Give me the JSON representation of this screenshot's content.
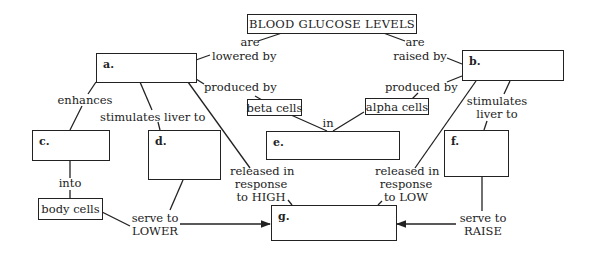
{
  "diagram": {
    "title": "BLOOD GLUCOSE LEVELS",
    "boxes": {
      "a": "a.",
      "b": "b.",
      "c": "c.",
      "d": "d.",
      "e": "e.",
      "f": "f.",
      "g": "g.",
      "beta": "beta cells",
      "alpha": "alpha cells",
      "body": "body cells"
    },
    "links": {
      "are_lowered_1": "are",
      "are_lowered_2": "lowered by",
      "are_raised_1": "are",
      "are_raised_2": "raised by",
      "produced_by_left": "produced by",
      "produced_by_right": "produced by",
      "in": "in",
      "enhances": "enhances",
      "stimulates_left": "stimulates liver to",
      "stimulates_right_1": "stimulates",
      "stimulates_right_2": "liver to",
      "into": "into",
      "released_high_1": "released in",
      "released_high_2": "response",
      "released_high_3": "to HIGH",
      "released_low_1": "released in",
      "released_low_2": "response",
      "released_low_3": "to LOW",
      "serve_lower_1": "serve to",
      "serve_lower_2": "LOWER",
      "serve_raise_1": "serve to",
      "serve_raise_2": "RAISE"
    }
  }
}
